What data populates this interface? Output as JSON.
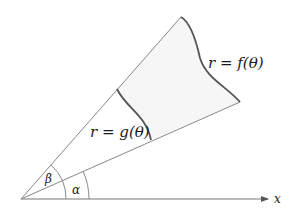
{
  "diagram": {
    "labels": {
      "outer_curve": "r = f(θ)",
      "inner_curve": "r = g(θ)",
      "angle_alpha": "α",
      "angle_beta": "β",
      "x_axis": "x"
    },
    "colors": {
      "stroke": "#7a7a7a",
      "curve": "#555555",
      "region_fill": "#f7f7f7",
      "text": "#1a1a1a"
    }
  }
}
